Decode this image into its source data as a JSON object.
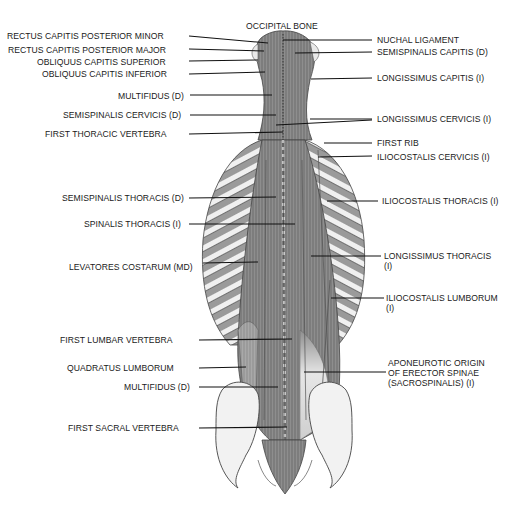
{
  "figure": {
    "labels_left": [
      {
        "id": "rcp-minor",
        "text": "RECTUS CAPITIS POSTERIOR MINOR",
        "x": 7,
        "y": 31,
        "lineFrom": 189,
        "lineTo": 268,
        "lineY": 36,
        "lineY2": 43
      },
      {
        "id": "rcp-major",
        "text": "RECTUS CAPITIS POSTERIOR MAJOR",
        "x": 8,
        "y": 45,
        "lineFrom": 189,
        "lineTo": 264,
        "lineY": 49,
        "lineY2": 51
      },
      {
        "id": "ocs",
        "text": "OBLIQUUS CAPITIS SUPERIOR",
        "x": 37,
        "y": 57,
        "lineFrom": 189,
        "lineTo": 258,
        "lineY": 61,
        "lineY2": 60
      },
      {
        "id": "oci",
        "text": "OBLIQUUS CAPITIS INFERIOR",
        "x": 42,
        "y": 69,
        "lineFrom": 189,
        "lineTo": 265,
        "lineY": 74,
        "lineY2": 72
      },
      {
        "id": "multifidus-d-upper",
        "text": "MULTIFIDUS (D)",
        "x": 118,
        "y": 91,
        "lineFrom": 190,
        "lineTo": 272,
        "lineY": 95,
        "lineY2": 95
      },
      {
        "id": "semispinalis-cervicis",
        "text": "SEMISPINALIS CERVICIS (D)",
        "x": 63,
        "y": 110,
        "lineFrom": 190,
        "lineTo": 276,
        "lineY": 115,
        "lineY2": 115
      },
      {
        "id": "first-thoracic-vertebra",
        "text": "FIRST THORACIC VERTEBRA",
        "x": 45,
        "y": 129,
        "lineFrom": 189,
        "lineTo": 283,
        "lineY": 134,
        "lineY2": 132
      },
      {
        "id": "semispinalis-thoracis",
        "text": "SEMISPINALIS THORACIS (D)",
        "x": 62,
        "y": 193,
        "lineFrom": 189,
        "lineTo": 276,
        "lineY": 198,
        "lineY2": 197
      },
      {
        "id": "spinalis-thoracis",
        "text": "SPINALIS THORACIS (I)",
        "x": 84,
        "y": 219,
        "lineFrom": 189,
        "lineTo": 295,
        "lineY": 224,
        "lineY2": 224
      },
      {
        "id": "levatores-costarum",
        "text": "LEVATORES COSTARUM (MD)",
        "x": 69,
        "y": 262,
        "lineFrom": 203,
        "lineTo": 258,
        "lineY": 263,
        "lineY2": 262
      },
      {
        "id": "first-lumbar-vertebra",
        "text": "FIRST LUMBAR VERTEBRA",
        "x": 60,
        "y": 335,
        "lineFrom": 199,
        "lineTo": 292,
        "lineY": 340,
        "lineY2": 339
      },
      {
        "id": "quadratus-lumborum",
        "text": "QUADRATUS LUMBORUM",
        "x": 67,
        "y": 363,
        "lineFrom": 199,
        "lineTo": 246,
        "lineY": 368,
        "lineY2": 367
      },
      {
        "id": "multifidus-d-lower",
        "text": "MULTIFIDUS (D)",
        "x": 124,
        "y": 382,
        "lineFrom": 199,
        "lineTo": 278,
        "lineY": 387,
        "lineY2": 387
      },
      {
        "id": "first-sacral-vertebra",
        "text": "FIRST SACRAL VERTEBRA",
        "x": 68,
        "y": 423,
        "lineFrom": 199,
        "lineTo": 287,
        "lineY": 428,
        "lineY2": 427
      }
    ],
    "labels_right": [
      {
        "id": "occipital-bone",
        "text": "OCCIPITAL BONE",
        "x": 246,
        "y": 21
      },
      {
        "id": "nuchal-ligament",
        "text": "NUCHAL LIGAMENT",
        "x": 377,
        "y": 35,
        "lineFrom": 283,
        "lineTo": 372,
        "lineY": 40,
        "lineY2": 40
      },
      {
        "id": "semispinalis-capitis",
        "text": "SEMISPINALIS CAPITIS (D)",
        "x": 377,
        "y": 47,
        "lineFrom": 295,
        "lineTo": 372,
        "lineY": 53,
        "lineY2": 52
      },
      {
        "id": "longissimus-capitis",
        "text": "LONGISSIMUS CAPITIS (I)",
        "x": 377,
        "y": 73,
        "lineFrom": 311,
        "lineTo": 372,
        "lineY": 79,
        "lineY2": 78
      },
      {
        "id": "longissimus-cervicis",
        "text": "LONGISSIMUS CERVICIS (I)",
        "x": 377,
        "y": 114,
        "lineFrom": 310,
        "lineTo": 372,
        "lineY": 119,
        "lineY2": 119
      },
      {
        "id": "first-rib",
        "text": "FIRST RIB",
        "x": 377,
        "y": 138,
        "lineFrom": 324,
        "lineTo": 372,
        "lineY": 143,
        "lineY2": 143
      },
      {
        "id": "iliocostalis-cervicis",
        "text": "ILIOCOSTALIS CERVICIS (I)",
        "x": 377,
        "y": 152,
        "lineFrom": 318,
        "lineTo": 372,
        "lineY": 157,
        "lineY2": 156
      },
      {
        "id": "iliocostalis-thoracis",
        "text": "ILIOCOSTALIS THORACIS (I)",
        "x": 382,
        "y": 196,
        "lineFrom": 327,
        "lineTo": 378,
        "lineY": 201,
        "lineY2": 201
      },
      {
        "id": "longissimus-thoracis",
        "text": "LONGISSIMUS THORACIS\n(I)",
        "x": 384,
        "y": 251,
        "lineFrom": 311,
        "lineTo": 381,
        "lineY": 256,
        "lineY2": 256
      },
      {
        "id": "iliocostalis-lumborum",
        "text": "ILIOCOSTALIS LUMBORUM\n(I)",
        "x": 386,
        "y": 293,
        "lineFrom": 331,
        "lineTo": 384,
        "lineY": 298,
        "lineY2": 298
      },
      {
        "id": "aponeurotic-origin",
        "text": "APONEUROTIC ORIGIN\nOF ERECTOR SPINAE\n(SACROSPINALIS)   (I)",
        "x": 388,
        "y": 358,
        "lineFrom": 304,
        "lineTo": 386,
        "lineY": 372,
        "lineY2": 372
      }
    ],
    "extra_leader_lines": [
      {
        "id": "longissimus-cervicis-second-line",
        "x1": 276,
        "y1": 125,
        "x2": 372,
        "y2": 120
      }
    ],
    "colors": {
      "background": "#ffffff",
      "label_text": "#1a1a1a",
      "leader_line": "#111111",
      "muscle_fill": "#8c8c8c",
      "muscle_dark": "#5a5a5a",
      "rib_fill": "#d8d8d8",
      "bone_fill": "#f2f2f2",
      "outline": "#444444"
    }
  }
}
